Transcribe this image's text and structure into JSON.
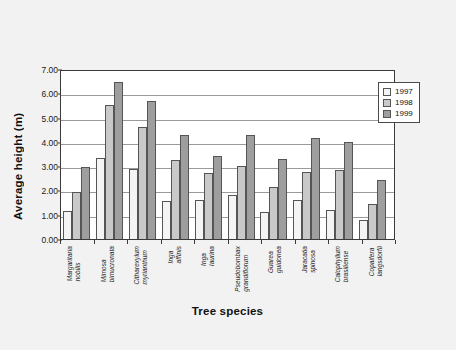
{
  "chart_data": {
    "type": "bar",
    "title": "",
    "xlabel": "Tree species",
    "ylabel": "Average height (m)",
    "ylim": [
      0,
      7
    ],
    "ytick_step": 1,
    "ytick_labels": [
      "0.00",
      "1.00",
      "2.00",
      "3.00",
      "4.00",
      "5.00",
      "6.00",
      "7.00"
    ],
    "grid": true,
    "legend_position": "top-right",
    "categories": [
      "Margaritaria nobilis",
      "Mimosa bimucronata",
      "Citharexylum myrianthum",
      "Inga affinis",
      "Inga laurina",
      "Pseudobombax grandiflorum",
      "Guarea guidonea",
      "Jaracatia spinosa",
      "Calophyllum brasiliense",
      "Copaifera langsdorfii"
    ],
    "categories_lines": [
      [
        "Margaritaria",
        "nobilis"
      ],
      [
        "Mimosa",
        "bimucronata"
      ],
      [
        "Citharexylum",
        "myrianthum"
      ],
      [
        "Inga",
        "affinis"
      ],
      [
        "Inga",
        "laurina"
      ],
      [
        "Pseudobombax",
        "grandiflorum"
      ],
      [
        "Guarea",
        "guidonea"
      ],
      [
        "Jaracatia",
        "spinosa"
      ],
      [
        "Calophyllum",
        "brasiliense"
      ],
      [
        "Copaifera",
        "langsdorfii"
      ]
    ],
    "series": [
      {
        "name": "1997",
        "color": "#f4f4f4",
        "values": [
          1.15,
          3.35,
          2.9,
          1.55,
          1.6,
          1.8,
          1.1,
          1.6,
          1.18,
          0.8
        ]
      },
      {
        "name": "1998",
        "color": "#c9c9c9",
        "values": [
          1.95,
          5.5,
          4.6,
          3.25,
          2.7,
          3.0,
          2.15,
          2.75,
          2.85,
          1.45
        ]
      },
      {
        "name": "1999",
        "color": "#9e9e9e",
        "values": [
          2.95,
          6.45,
          5.7,
          4.3,
          3.4,
          4.3,
          3.3,
          4.15,
          4.0,
          2.45
        ]
      }
    ]
  },
  "legend": {
    "items": [
      {
        "label": "1997",
        "color": "#f4f4f4"
      },
      {
        "label": "1998",
        "color": "#c9c9c9"
      },
      {
        "label": "1999",
        "color": "#9e9e9e"
      }
    ]
  },
  "axes": {
    "y_title": "Average height (m)",
    "x_title": "Tree species"
  },
  "colors": {
    "background": "#f2f2f2",
    "plot_background": "#ffffff",
    "axis": "#3a3a3a",
    "gridline": "#9a9a9a",
    "text": "#111111"
  }
}
